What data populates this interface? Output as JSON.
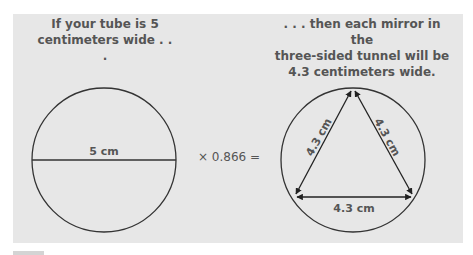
{
  "left": {
    "caption": "If your tube is 5\ncentimeters wide . . .",
    "diameter_label": "5 cm"
  },
  "operator": {
    "label": "× 0.866 ="
  },
  "right": {
    "caption": ". . . then each mirror in the\nthree-sided tunnel will be\n4.3 centimeters wide.",
    "side_labels": [
      "4.3 cm",
      "4.3 cm",
      "4.3 cm"
    ]
  },
  "colors": {
    "panel": "#e7e7e7",
    "stroke": "#333333",
    "text": "#555555"
  }
}
